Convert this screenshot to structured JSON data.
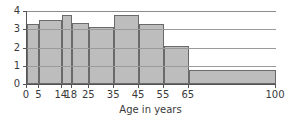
{
  "chart_data": {
    "type": "bar",
    "title": "",
    "subtitle": "",
    "xlabel": "Age in years",
    "ylabel": "",
    "xlim": [
      0,
      100
    ],
    "ylim": [
      0,
      4
    ],
    "grid": true,
    "legend": null,
    "note": "Histogram with unequal class widths; bar heights are densities (percent per year)",
    "x_tick_labels": [
      "0",
      "5",
      "14",
      "18",
      "25",
      "35",
      "45",
      "55",
      "65",
      "100"
    ],
    "x_tick_values": [
      0,
      5,
      14,
      18,
      25,
      35,
      45,
      55,
      65,
      100
    ],
    "y_tick_labels": [
      "0",
      "1",
      "2",
      "3",
      "4"
    ],
    "y_tick_values": [
      0,
      1,
      2,
      3,
      4
    ],
    "bins": [
      {
        "label": "0-5",
        "start": 0,
        "end": 5,
        "value": 3.3
      },
      {
        "label": "5-14",
        "start": 5,
        "end": 14,
        "value": 3.5
      },
      {
        "label": "14-18",
        "start": 14,
        "end": 18,
        "value": 3.8
      },
      {
        "label": "18-25",
        "start": 18,
        "end": 25,
        "value": 3.35
      },
      {
        "label": "25-35",
        "start": 25,
        "end": 35,
        "value": 3.15
      },
      {
        "label": "35-45",
        "start": 35,
        "end": 45,
        "value": 3.8
      },
      {
        "label": "45-55",
        "start": 45,
        "end": 55,
        "value": 3.3
      },
      {
        "label": "55-65",
        "start": 55,
        "end": 65,
        "value": 2.1
      },
      {
        "label": "65-100",
        "start": 65,
        "end": 100,
        "value": 0.75
      }
    ],
    "colors": {
      "bar_fill": "#bdbdbd",
      "bar_border": "#6a6a6a",
      "axis": "#555555",
      "grid": "#9a9a9a",
      "text": "#3a3a3a",
      "background": "#ffffff"
    }
  }
}
